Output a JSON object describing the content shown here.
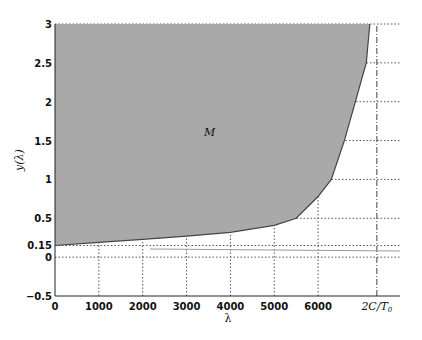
{
  "chart_data": {
    "type": "area",
    "title": "",
    "xlabel": "λ",
    "ylabel": "y(λ)",
    "region_label": "M",
    "xlim": [
      0,
      7850
    ],
    "ylim": [
      -0.5,
      3
    ],
    "grid": "partial dotted",
    "x_ticks": [
      "0",
      "1000",
      "2000",
      "3000",
      "4000",
      "5000",
      "6000",
      "2C/T₀"
    ],
    "x_tick_values": [
      0,
      1000,
      2000,
      3000,
      4000,
      5000,
      6000,
      7340
    ],
    "y_ticks": [
      "-0.5",
      "0",
      "0.15",
      "0.5",
      "1",
      "1.5",
      "2",
      "2.5",
      "3"
    ],
    "y_tick_values": [
      -0.5,
      0,
      0.15,
      0.5,
      1,
      1.5,
      2,
      2.5,
      3
    ],
    "special_x_label": {
      "text": "2C/T",
      "subscript": "0",
      "value": 7340,
      "style": "dash-dot vertical line"
    },
    "boundary_curve": {
      "x": [
        0,
        1000,
        2000,
        3000,
        4000,
        5000,
        5500,
        6000,
        6300,
        6600,
        6850,
        7000,
        7100,
        7180
      ],
      "y": [
        0.15,
        0.19,
        0.23,
        0.27,
        0.32,
        0.41,
        0.5,
        0.78,
        1.0,
        1.5,
        2.0,
        2.3,
        2.5,
        3.0
      ]
    },
    "fill_color": "#a9a9a9",
    "curve_color": "#444444"
  }
}
